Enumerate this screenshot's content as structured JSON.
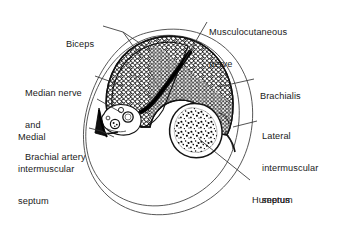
{
  "figure": {
    "type": "anatomical-cross-section",
    "region": "Arm (mid-humerus transverse section)",
    "colors": {
      "ink": "#1a1a1a",
      "outline": "#3a3a3a",
      "muscle_fill": "#ffffff",
      "muscle_texture": "#000000",
      "bone_cortex": "#1a1a1a",
      "marrow_stipple": "#000000",
      "nerve_dark": "#111111",
      "background": "#ffffff"
    },
    "labels": [
      {
        "name": "biceps",
        "lines": [
          "Biceps"
        ],
        "x": 66,
        "y": 23,
        "leader": "forked-two-branch",
        "side": "left"
      },
      {
        "name": "musculocutaneous-nerve",
        "lines": [
          "Musculocutaneous",
          "nerve"
        ],
        "x": 209,
        "y": 10,
        "leader": "single",
        "side": "right"
      },
      {
        "name": "median-nerve-and-brachial-artery",
        "lines": [
          "Median nerve",
          "and",
          "Brachial artery"
        ],
        "x": 25,
        "y": 70,
        "leader": "double",
        "side": "left"
      },
      {
        "name": "brachialis",
        "lines": [
          "Brachialis"
        ],
        "x": 258,
        "y": 74,
        "leader": "single",
        "side": "right"
      },
      {
        "name": "medial-intermuscular-septum",
        "lines": [
          "Medial",
          "intermuscular",
          "septum"
        ],
        "x": 18,
        "y": 114,
        "leader": "single",
        "side": "left"
      },
      {
        "name": "lateral-intermuscular-septum",
        "lines": [
          "Lateral",
          "intermuscular",
          "septum"
        ],
        "x": 260,
        "y": 113,
        "leader": "single",
        "side": "right"
      },
      {
        "name": "humerus",
        "lines": [
          "Humerus"
        ],
        "x": 252,
        "y": 176,
        "leader": "single",
        "side": "right"
      }
    ],
    "structures": [
      "arm-outer-outline",
      "arm-inner-outline",
      "anterior-muscle-compartment",
      "biceps-brachii",
      "brachialis",
      "musculocutaneous-nerve",
      "humerus",
      "bone-marrow",
      "neurovascular-bundle",
      "medial-intermuscular-septum",
      "lateral-intermuscular-septum"
    ]
  }
}
